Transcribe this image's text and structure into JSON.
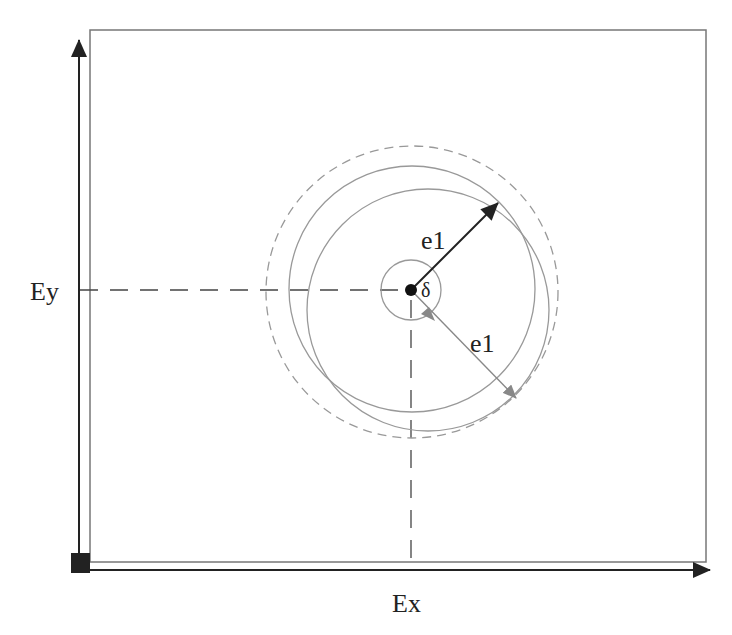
{
  "diagram": {
    "type": "geometric-tolerance-diagram",
    "axes": {
      "x_label": "Ex",
      "y_label": "Ey"
    },
    "center_point": {
      "x": 411,
      "y": 290,
      "angle_label": "δ"
    },
    "circles": [
      {
        "id": "tolerance-zone-dashed",
        "cx": 412,
        "cy": 292,
        "r": 146,
        "style": "dashed"
      },
      {
        "id": "nominal-circle",
        "cx": 412,
        "cy": 289,
        "r": 123,
        "style": "solid"
      },
      {
        "id": "offset-circle",
        "cx": 428,
        "cy": 310,
        "r": 121,
        "style": "solid"
      },
      {
        "id": "deviation-circle",
        "cx": 411,
        "cy": 290,
        "r": 30,
        "style": "solid"
      }
    ],
    "radius_arrows": [
      {
        "label": "e1",
        "color": "#222222",
        "from": [
          411,
          290
        ],
        "to": [
          498,
          203
        ]
      },
      {
        "label": "e1",
        "color": "#888888",
        "from": [
          411,
          290
        ],
        "to": [
          516,
          398
        ]
      }
    ],
    "colors": {
      "axis": "#222222",
      "frame": "#777777",
      "circle": "#999999",
      "dashed": "#999999",
      "guide": "#444444"
    }
  }
}
